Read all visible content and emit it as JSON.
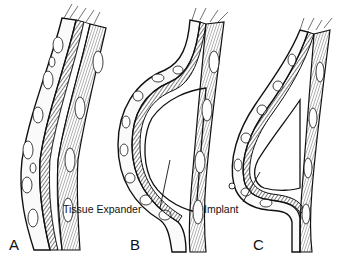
{
  "figure": {
    "panels": [
      {
        "id": "A",
        "letter": "A",
        "description": "Chest wall tissue layers (skin, subcutaneous fat, muscle) before expansion"
      },
      {
        "id": "B",
        "letter": "B",
        "description": "Tissue expander placed beneath muscle layer",
        "callout": "Tissue Expander"
      },
      {
        "id": "C",
        "letter": "C",
        "description": "Permanent implant placed beneath muscle layer",
        "callout": "Implant"
      }
    ],
    "colors": {
      "ink": "#111111",
      "background": "#ffffff",
      "fat_fill": "#f4f4f4"
    }
  }
}
